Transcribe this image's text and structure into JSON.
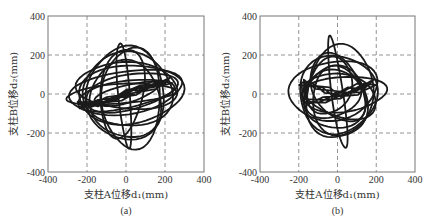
{
  "chart_data": [
    {
      "type": "line",
      "panel_label": "(a)",
      "xlabel": "支柱A位移d₁(mm)",
      "ylabel": "支柱B位移d₂(mm)",
      "xlim": [
        -400,
        400
      ],
      "ylim": [
        -400,
        400
      ],
      "xticks": [
        -400,
        -200,
        0,
        200,
        400
      ],
      "yticks": [
        -400,
        -200,
        0,
        200,
        400
      ],
      "xtick_labels": [
        "-400",
        "-200",
        "0",
        "200",
        "400"
      ],
      "ytick_labels": [
        "-400",
        "-200",
        "0",
        "200",
        "400"
      ],
      "grid": true,
      "series": [
        {
          "name": "orbit loops (ellipse approx: cx, cy, rx, ry, rotation_deg)",
          "loops": [
            [
              0,
              10,
              290,
              110,
              8
            ],
            [
              20,
              0,
              270,
              150,
              5
            ],
            [
              -10,
              -5,
              250,
              70,
              10
            ],
            [
              10,
              20,
              230,
              190,
              -5
            ],
            [
              0,
              0,
              200,
              240,
              0
            ],
            [
              30,
              -20,
              150,
              260,
              0
            ],
            [
              -20,
              10,
              110,
              230,
              -8
            ],
            [
              0,
              0,
              170,
              45,
              15
            ],
            [
              20,
              10,
              240,
              90,
              12
            ],
            [
              -30,
              0,
              280,
              50,
              4
            ],
            [
              10,
              40,
              260,
              120,
              -3
            ],
            [
              0,
              -30,
              180,
              200,
              20
            ],
            [
              -10,
              0,
              30,
              270,
              5
            ]
          ],
          "core_points": [
            [
              -220,
              -60
            ],
            [
              -150,
              -50
            ],
            [
              -80,
              -30
            ],
            [
              0,
              10
            ],
            [
              80,
              30
            ],
            [
              160,
              55
            ],
            [
              220,
              70
            ],
            [
              150,
              40
            ],
            [
              60,
              10
            ],
            [
              -40,
              -20
            ],
            [
              -140,
              -45
            ],
            [
              -230,
              -55
            ]
          ]
        }
      ]
    },
    {
      "type": "line",
      "panel_label": "(b)",
      "xlabel": "支柱A位移d₁(mm)",
      "ylabel": "支柱B位移d₂(mm)",
      "xlim": [
        -400,
        400
      ],
      "ylim": [
        -400,
        400
      ],
      "xticks": [
        -400,
        -200,
        0,
        200,
        400
      ],
      "yticks": [
        -400,
        -200,
        0,
        200,
        400
      ],
      "xtick_labels": [
        "-400",
        "-200",
        "0",
        "200",
        "400"
      ],
      "ytick_labels": [
        "-400",
        "-200",
        "0",
        "200",
        "400"
      ],
      "grid": true,
      "series": [
        {
          "name": "orbit loops (ellipse approx: cx, cy, rx, ry, rotation_deg)",
          "loops": [
            [
              -20,
              20,
              230,
              150,
              10
            ],
            [
              0,
              0,
              200,
              200,
              0
            ],
            [
              10,
              10,
              170,
              240,
              -10
            ],
            [
              -30,
              0,
              150,
              120,
              20
            ],
            [
              20,
              -10,
              190,
              110,
              -15
            ],
            [
              0,
              30,
              120,
              190,
              30
            ],
            [
              -10,
              -20,
              160,
              160,
              45
            ],
            [
              30,
              0,
              220,
              90,
              5
            ],
            [
              -40,
              40,
              110,
              150,
              -20
            ],
            [
              10,
              -40,
              140,
              180,
              10
            ],
            [
              0,
              0,
              30,
              290,
              8
            ]
          ],
          "core_points": [
            [
              -180,
              60
            ],
            [
              -120,
              40
            ],
            [
              -60,
              20
            ],
            [
              0,
              0
            ],
            [
              60,
              20
            ],
            [
              120,
              40
            ],
            [
              180,
              60
            ],
            [
              100,
              10
            ],
            [
              20,
              -10
            ],
            [
              -80,
              -30
            ],
            [
              -160,
              -40
            ]
          ]
        }
      ]
    }
  ]
}
